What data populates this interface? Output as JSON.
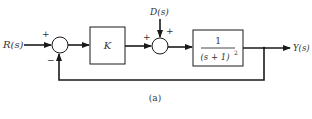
{
  "diagram": {
    "type": "block-diagram",
    "input_label": "R(s)",
    "output_label": "Y(s)",
    "disturbance_label": "D(s)",
    "summing_junction_1": {
      "plus_sign": "+",
      "minus_sign": "−"
    },
    "summing_junction_2": {
      "plus_sign_left": "+",
      "plus_sign_top": "+"
    },
    "controller_block": {
      "label": "K"
    },
    "plant_block": {
      "numerator": "1",
      "denominator": "(s + 1)",
      "denominator_exponent": "2"
    },
    "caption": "(a)"
  },
  "colors": {
    "line": "#1a1a1a",
    "text": "#333333"
  }
}
